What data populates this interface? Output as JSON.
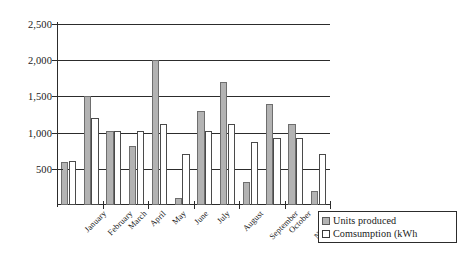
{
  "chart_data": {
    "type": "bar",
    "title": "",
    "xlabel": "",
    "ylabel": "",
    "ylim": [
      0,
      2500
    ],
    "yticks": [
      500,
      1000,
      1500,
      2000,
      2500
    ],
    "ytick_labels": [
      "500",
      "1,000",
      "1,500",
      "2,000",
      "2,500"
    ],
    "grid": true,
    "legend_position": "bottom-right",
    "categories": [
      "January",
      "February",
      "March",
      "April",
      "May",
      "June",
      "July",
      "August",
      "September",
      "October",
      "November",
      "December"
    ],
    "series": [
      {
        "name": "Units produced",
        "color": "#b3b3b3",
        "values": [
          600,
          1500,
          1020,
          820,
          2000,
          100,
          1300,
          1700,
          320,
          1400,
          1120,
          200
        ]
      },
      {
        "name": "Comsumption (kWh",
        "color": "#ffffff",
        "values": [
          610,
          1200,
          1020,
          1020,
          1120,
          700,
          1020,
          1120,
          870,
          930,
          930,
          700
        ]
      }
    ]
  },
  "legend": {
    "items": [
      {
        "label": "Units produced",
        "swatch": "produced"
      },
      {
        "label": "Comsumption (kWh",
        "swatch": "consumption"
      }
    ]
  },
  "colors": {
    "produced": "#b3b3b3",
    "consumption": "#ffffff",
    "axis": "#2c2c2c",
    "background": "#ffffff"
  }
}
